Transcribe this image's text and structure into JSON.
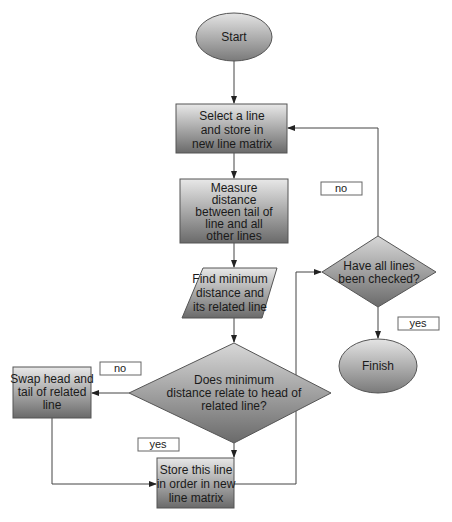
{
  "diagram": {
    "type": "flowchart",
    "nodes": {
      "start": {
        "shape": "oval",
        "lines": [
          "Start"
        ]
      },
      "select": {
        "shape": "rectangle",
        "lines": [
          "Select a line",
          "and store in",
          "new line matrix"
        ]
      },
      "measure": {
        "shape": "rectangle",
        "lines": [
          "Measure",
          "distance",
          "between tail of",
          "line and all",
          "other lines"
        ]
      },
      "find": {
        "shape": "parallelogram",
        "lines": [
          "Find minimum",
          "distance and",
          "its related line"
        ]
      },
      "decision_head": {
        "shape": "diamond",
        "lines": [
          "Does minimum",
          "distance relate to head of",
          "related line?"
        ]
      },
      "swap": {
        "shape": "rectangle",
        "lines": [
          "Swap head and",
          "tail of related",
          "line"
        ]
      },
      "store": {
        "shape": "rectangle",
        "lines": [
          "Store this line",
          "in order in new",
          "line matrix"
        ]
      },
      "decision_all": {
        "shape": "diamond",
        "lines": [
          "Have all lines",
          "been checked?"
        ]
      },
      "finish": {
        "shape": "oval",
        "lines": [
          "Finish"
        ]
      }
    },
    "edge_labels": {
      "head_no": "no",
      "head_yes": "yes",
      "all_no": "no",
      "all_yes": "yes"
    },
    "edges": [
      [
        "start",
        "select"
      ],
      [
        "select",
        "measure"
      ],
      [
        "measure",
        "find"
      ],
      [
        "find",
        "decision_head"
      ],
      [
        "decision_head",
        "swap",
        "no"
      ],
      [
        "decision_head",
        "store",
        "yes"
      ],
      [
        "swap",
        "store"
      ],
      [
        "store",
        "decision_all"
      ],
      [
        "decision_all",
        "select",
        "no"
      ],
      [
        "decision_all",
        "finish",
        "yes"
      ]
    ],
    "colors": {
      "fill_light": "#e6e6e6",
      "fill_dark": "#6e6e6e",
      "stroke": "#555555",
      "line": "#444444"
    }
  }
}
